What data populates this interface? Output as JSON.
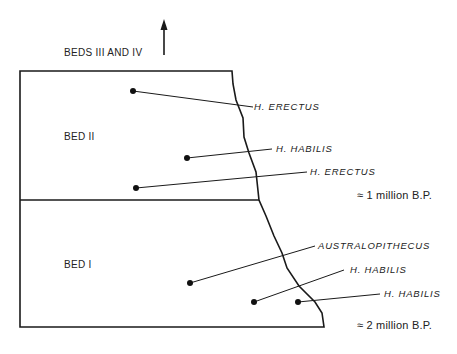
{
  "diagram": {
    "top_label": "BEDS III AND IV",
    "beds": [
      {
        "name": "BED II"
      },
      {
        "name": "BED I"
      }
    ],
    "fossils": [
      {
        "label": "H. ERECTUS",
        "bed": "BED II"
      },
      {
        "label": "H. HABILIS",
        "bed": "BED II"
      },
      {
        "label": "H. ERECTUS",
        "bed": "BED II"
      },
      {
        "label": "AUSTRALOPITHECUS",
        "bed": "BED I"
      },
      {
        "label": "H. HABILIS",
        "bed": "BED I"
      },
      {
        "label": "H. HABILIS",
        "bed": "BED I"
      }
    ],
    "dates": [
      {
        "label": "≈ 1 million B.P."
      },
      {
        "label": "≈ 2 million B.P."
      }
    ]
  }
}
